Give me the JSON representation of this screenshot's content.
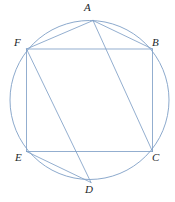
{
  "figure": {
    "stroke_color": "#7f9fc6",
    "label_color": "#23272b",
    "background_color": "#ffffff",
    "circle": {
      "cx": 89.5,
      "cy": 100,
      "r": 79.5
    },
    "vertices": [
      {
        "id": "A",
        "label": "A",
        "x": 93,
        "y": 20.5,
        "label_x": 84,
        "label_y": 2
      },
      {
        "id": "B",
        "label": "B",
        "x": 152.5,
        "y": 49,
        "label_x": 152,
        "label_y": 37
      },
      {
        "id": "C",
        "label": "C",
        "x": 152.5,
        "y": 151.5,
        "label_x": 152,
        "label_y": 152
      },
      {
        "id": "D",
        "label": "D",
        "x": 91,
        "y": 182.5,
        "label_x": 85,
        "label_y": 184
      },
      {
        "id": "E",
        "label": "E",
        "x": 26.5,
        "y": 151.5,
        "label_x": 15,
        "label_y": 152
      },
      {
        "id": "F",
        "label": "F",
        "x": 26.5,
        "y": 49,
        "label_x": 14,
        "label_y": 37
      }
    ],
    "edges": [
      {
        "name": "segment-FB",
        "from": "F",
        "to": "B"
      },
      {
        "name": "segment-BC",
        "from": "B",
        "to": "C"
      },
      {
        "name": "segment-CE",
        "from": "C",
        "to": "E"
      },
      {
        "name": "segment-EF",
        "from": "E",
        "to": "F"
      },
      {
        "name": "segment-AF",
        "from": "A",
        "to": "F"
      },
      {
        "name": "segment-AB",
        "from": "A",
        "to": "B"
      },
      {
        "name": "segment-AC",
        "from": "A",
        "to": "C"
      },
      {
        "name": "segment-FD",
        "from": "F",
        "to": "D"
      },
      {
        "name": "segment-ED",
        "from": "E",
        "to": "D"
      }
    ]
  }
}
